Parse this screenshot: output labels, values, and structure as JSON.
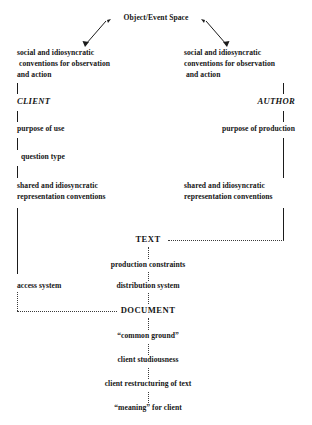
{
  "diagram": {
    "title": "Object/Event Space",
    "background_color": "#ffffff",
    "ink_color": "#151515",
    "nodes": {
      "root": "Object/Event Space",
      "left_conventions_line1": "social and idiosyncratic",
      "left_conventions_line2": "conventions for observation",
      "left_conventions_line3": "and action",
      "right_conventions_line1": "social and idiosyncratic",
      "right_conventions_line2": "conventions for observation",
      "right_conventions_line3": "and action",
      "client": "CLIENT",
      "author": "AUTHOR",
      "purpose_of_use": "purpose of use",
      "purpose_of_production": "purpose of production",
      "question_type": "question type",
      "left_representation_line1": "shared and idiosyncratic",
      "left_representation_line2": "representation conventions",
      "right_representation_line1": "shared and idiosyncratic",
      "right_representation_line2": "representation conventions",
      "text": "TEXT",
      "production_constraints": "production constraints",
      "access_system": "access system",
      "distribution_system": "distribution system",
      "document": "DOCUMENT",
      "common_ground": "“common ground”",
      "client_studiousness": "client studiousness",
      "client_restructuring": "client restructuring of text",
      "meaning_for_client": "“meaning” for client"
    }
  }
}
